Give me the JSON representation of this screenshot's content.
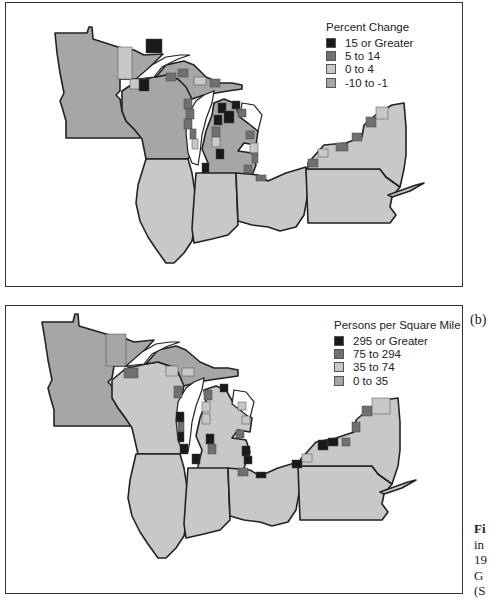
{
  "figure": {
    "panel_b_label": "(b)",
    "caption_fragment": [
      "Fi",
      "in",
      "19",
      "G",
      "(S"
    ]
  },
  "colors": {
    "class1": "#1a1a1a",
    "class2": "#707070",
    "class3": "#c8c8c8",
    "class4": "#a6a6a6",
    "lake": "#ffffff",
    "border": "#222222"
  },
  "panels": [
    {
      "id": "a",
      "legend": {
        "title": "Percent Change",
        "items": [
          {
            "label": "15 or Greater",
            "color": "#1a1a1a"
          },
          {
            "label": "5 to 14",
            "color": "#707070"
          },
          {
            "label": "0 to 4",
            "color": "#c8c8c8"
          },
          {
            "label": "-10 to -1",
            "color": "#a6a6a6"
          }
        ]
      },
      "states": [
        "Minnesota",
        "Wisconsin",
        "Michigan",
        "Illinois",
        "Indiana",
        "Ohio",
        "Pennsylvania",
        "New York"
      ]
    },
    {
      "id": "b",
      "legend": {
        "title": "Persons per Square Mile",
        "items": [
          {
            "label": "295 or Greater",
            "color": "#1a1a1a"
          },
          {
            "label": "75 to 294",
            "color": "#707070"
          },
          {
            "label": "35 to 74",
            "color": "#c8c8c8"
          },
          {
            "label": "0 to 35",
            "color": "#a6a6a6"
          }
        ]
      },
      "states": [
        "Minnesota",
        "Wisconsin",
        "Michigan",
        "Illinois",
        "Indiana",
        "Ohio",
        "Pennsylvania",
        "New York"
      ]
    }
  ]
}
